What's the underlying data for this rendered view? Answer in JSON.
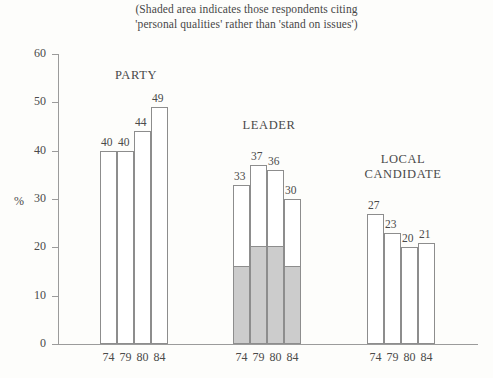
{
  "subtitle": {
    "line1": "(Shaded area indicates those respondents citing",
    "line2": "'personal qualities' rather than 'stand on issues')"
  },
  "axis": {
    "y_title": "%",
    "y_ticks": [
      "60",
      "50",
      "40",
      "30",
      "20",
      "10",
      "0"
    ]
  },
  "colors": {
    "shade": "#cccccc",
    "bar_outline": "#8d8d8d",
    "bar_fill": "#ffffff",
    "axis": "#9b9b9b",
    "text": "#4a4a4a",
    "background": "#fdfdfb"
  },
  "chart_data": {
    "type": "bar",
    "title": "",
    "subtitle": "(Shaded area indicates those respondents citing 'personal qualities' rather than 'stand on issues')",
    "xlabel": "",
    "ylabel": "%",
    "ylim": [
      0,
      60
    ],
    "ytick_step": 10,
    "grid": false,
    "legend": "none",
    "categories": [
      "74",
      "79",
      "80",
      "84"
    ],
    "groups": [
      {
        "name": "PARTY",
        "title_lines": [
          "PARTY"
        ],
        "values": [
          40,
          40,
          44,
          49
        ],
        "shaded_values": [
          0,
          0,
          0,
          0
        ],
        "labels": [
          "40",
          "40",
          "44",
          "49"
        ],
        "x_labels": [
          "74",
          "79",
          "80",
          "84"
        ]
      },
      {
        "name": "LEADER",
        "title_lines": [
          "LEADER"
        ],
        "values": [
          33,
          37,
          36,
          30
        ],
        "shaded_values": [
          16,
          20,
          20,
          16
        ],
        "labels": [
          "33",
          "37",
          "36",
          "30"
        ],
        "x_labels": [
          "74",
          "79",
          "80",
          "84"
        ]
      },
      {
        "name": "LOCAL CANDIDATE",
        "title_lines": [
          "LOCAL",
          "CANDIDATE"
        ],
        "values": [
          27,
          23,
          20,
          21
        ],
        "shaded_values": [
          0,
          0,
          0,
          0
        ],
        "labels": [
          "27",
          "23",
          "20",
          "21"
        ],
        "x_labels": [
          "74",
          "79",
          "80",
          "84"
        ]
      }
    ]
  }
}
